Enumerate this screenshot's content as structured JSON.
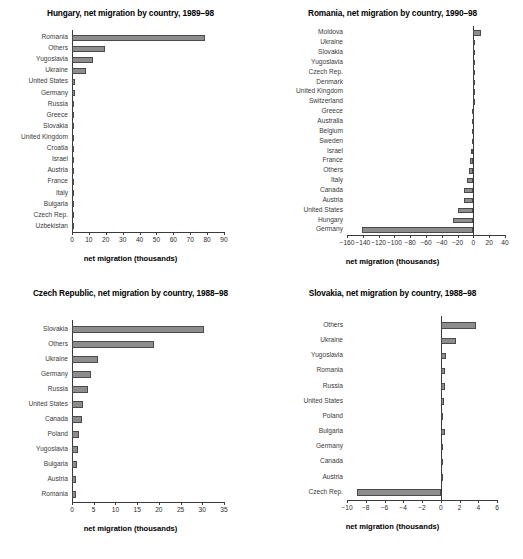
{
  "page": {
    "figure_kind": "four-panel horizontal bar charts",
    "axis_caption": "net migration (thousands)"
  },
  "chart_data": [
    {
      "id": "hungary",
      "type": "bar",
      "orientation": "horizontal",
      "title": "Hungary, net migration by country, 1989–98",
      "xlabel": "net migration (thousands)",
      "ylabel": "",
      "xlim": [
        0,
        90
      ],
      "xticks": [
        0,
        10,
        20,
        30,
        40,
        50,
        60,
        70,
        80,
        90
      ],
      "xticklabels": [
        "0",
        "10",
        "20",
        "30",
        "40",
        "50",
        "60",
        "70",
        "80",
        "90"
      ],
      "grid": false,
      "legend": "none",
      "categories": [
        "Romania",
        "Others",
        "Yugoslavia",
        "Ukraine",
        "United States",
        "Germany",
        "Russia",
        "Greece",
        "Slovakia",
        "United Kingdom",
        "Croatia",
        "Israel",
        "Austria",
        "France",
        "Italy",
        "Bulgaria",
        "Czech Rep.",
        "Uzbekistan"
      ],
      "values": [
        78.5,
        19.5,
        12.5,
        8.3,
        1.8,
        1.5,
        1.3,
        0.9,
        0.8,
        0.7,
        0.6,
        0.55,
        0.5,
        0.45,
        0.4,
        0.35,
        0.2,
        0.15
      ]
    },
    {
      "id": "romania",
      "type": "bar",
      "orientation": "horizontal",
      "title": "Romania, net migration by country, 1990–98",
      "xlabel": "net migration (thousands)",
      "ylabel": "",
      "xlim": [
        -160,
        40
      ],
      "xticks": [
        -160,
        -140,
        -120,
        -100,
        -80,
        -60,
        -40,
        -20,
        0,
        20,
        40
      ],
      "xticklabels": [
        "−160",
        "−140",
        "−120",
        "−100",
        "−80",
        "−60",
        "−40",
        "−20",
        "0",
        "20",
        "40"
      ],
      "grid": false,
      "legend": "none",
      "categories": [
        "Moldova",
        "Ukraine",
        "Slovakia",
        "Yugoslavia",
        "Czech Rep.",
        "Denmark",
        "United Kingdom",
        "Switzerland",
        "Greece",
        "Australia",
        "Belgium",
        "Sweden",
        "Israel",
        "France",
        "Others",
        "Italy",
        "Canada",
        "Austria",
        "United States",
        "Hungary",
        "Germany"
      ],
      "values": [
        9.0,
        -0.3,
        -0.4,
        -0.5,
        -0.6,
        -0.7,
        -0.9,
        -1.0,
        -1.2,
        -1.4,
        -1.6,
        -2.0,
        -2.6,
        -4.4,
        -5.0,
        -8.5,
        -12.0,
        -12.5,
        -19.5,
        -25.5,
        -141.0
      ]
    },
    {
      "id": "czech",
      "type": "bar",
      "orientation": "horizontal",
      "title": "Czech Republic, net migration by country, 1988–98",
      "xlabel": "net migration (thousands)",
      "ylabel": "",
      "xlim": [
        0,
        35
      ],
      "xticks": [
        0,
        5,
        10,
        15,
        20,
        25,
        30,
        35
      ],
      "xticklabels": [
        "0",
        "5",
        "10",
        "15",
        "20",
        "25",
        "30",
        "35"
      ],
      "grid": false,
      "legend": "none",
      "categories": [
        "Slovakia",
        "Others",
        "Ukraine",
        "Germany",
        "Russia",
        "United States",
        "Canada",
        "Poland",
        "Yugoslavia",
        "Bulgaria",
        "Austria",
        "Romania"
      ],
      "values": [
        30.5,
        18.9,
        6.1,
        4.4,
        3.6,
        2.5,
        2.2,
        1.6,
        1.4,
        1.2,
        1.0,
        0.9
      ]
    },
    {
      "id": "slovakia",
      "type": "bar",
      "orientation": "horizontal",
      "title": "Slovakia, net migration by country, 1988–98",
      "xlabel": "net migration (thousands)",
      "ylabel": "",
      "xlim": [
        -10,
        6
      ],
      "xticks": [
        -10,
        -8,
        -6,
        -4,
        -2,
        0,
        2,
        4,
        6
      ],
      "xticklabels": [
        "−10",
        "−8",
        "−6",
        "−4",
        "−2",
        "0",
        "2",
        "4",
        "6"
      ],
      "grid": false,
      "legend": "none",
      "categories": [
        "Others",
        "Ukraine",
        "Yugoslavia",
        "Romania",
        "Russia",
        "United States",
        "Poland",
        "Bulgaria",
        "Germany",
        "Canada",
        "Austria",
        "Czech Rep."
      ],
      "values": [
        3.75,
        1.65,
        0.6,
        0.5,
        0.4,
        0.35,
        0.25,
        0.4,
        0.2,
        0.2,
        0.1,
        -8.95
      ]
    }
  ]
}
